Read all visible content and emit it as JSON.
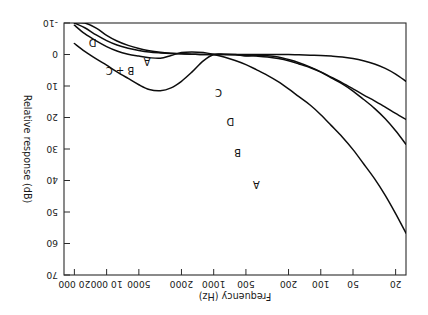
{
  "chart_data": {
    "type": "line",
    "title": "",
    "xlabel": "Frequency (Hz)",
    "ylabel": "Relative response (dB)",
    "xscale": "log",
    "xlim": [
      16,
      25000
    ],
    "ylim": [
      -10,
      70
    ],
    "grid": false,
    "legend": "inline-curve-labels",
    "rotated_180": true,
    "xticks": [
      20,
      50,
      100,
      200,
      500,
      1000,
      2000,
      5000,
      10000,
      20000
    ],
    "xtick_labels": [
      "20",
      "50",
      "100",
      "200",
      "500",
      "1000",
      "2000",
      "5000",
      "10 000",
      "20 000"
    ],
    "yticks": [
      -10,
      0,
      10,
      20,
      30,
      40,
      50,
      60,
      70
    ],
    "ytick_labels": [
      "-10",
      "0",
      "10",
      "20",
      "30",
      "40",
      "50",
      "60",
      "70"
    ],
    "series": [
      {
        "name": "A",
        "label": "A",
        "x": [
          16,
          20,
          25,
          31.5,
          40,
          50,
          63,
          80,
          100,
          125,
          160,
          200,
          250,
          315,
          400,
          500,
          630,
          800,
          1000,
          1250,
          1600,
          2000,
          2500,
          3150,
          4000,
          5000,
          6300,
          8000,
          10000,
          12500,
          16000,
          20000
        ],
        "y": [
          56.7,
          50.5,
          44.7,
          39.4,
          34.6,
          30.2,
          26.2,
          22.5,
          19.1,
          16.1,
          13.4,
          10.9,
          8.6,
          6.6,
          4.8,
          3.2,
          1.9,
          0.8,
          0.0,
          -0.6,
          -0.8,
          -0.6,
          0.3,
          1.2,
          1.0,
          0.5,
          -0.1,
          -1.1,
          -2.5,
          -4.3,
          -6.6,
          -9.3
        ]
      },
      {
        "name": "B",
        "label": "B",
        "x": [
          16,
          20,
          25,
          31.5,
          40,
          50,
          63,
          80,
          100,
          125,
          160,
          200,
          250,
          315,
          400,
          500,
          630,
          800,
          1000,
          1250,
          1600,
          2000,
          2500,
          3150,
          4000,
          5000,
          6300,
          8000,
          10000,
          12500,
          16000,
          20000
        ],
        "y": [
          28.5,
          24.2,
          20.4,
          17.1,
          14.2,
          11.6,
          9.3,
          7.4,
          5.6,
          4.2,
          3.0,
          2.0,
          1.3,
          0.8,
          0.5,
          0.3,
          0.1,
          0.0,
          0.0,
          0.0,
          -0.1,
          -0.2,
          -0.4,
          -0.7,
          -1.2,
          -1.9,
          -2.9,
          -4.3,
          -6.1,
          -8.4,
          -11.1,
          -14.1
        ]
      },
      {
        "name": "C",
        "label": "C",
        "x": [
          16,
          20,
          25,
          31.5,
          40,
          50,
          63,
          80,
          100,
          125,
          160,
          200,
          250,
          315,
          400,
          500,
          630,
          800,
          1000,
          1250,
          1600,
          2000,
          2500,
          3150,
          4000,
          5000,
          6300,
          8000,
          10000,
          12500,
          16000,
          20000
        ],
        "y": [
          8.5,
          6.2,
          4.4,
          3.0,
          2.0,
          1.3,
          0.8,
          0.5,
          0.3,
          0.2,
          0.1,
          0.0,
          0.0,
          0.0,
          0.0,
          0.0,
          0.0,
          0.0,
          0.0,
          0.0,
          -0.1,
          -0.2,
          -0.3,
          -0.5,
          -0.8,
          -1.3,
          -2.0,
          -3.0,
          -4.4,
          -6.2,
          -8.5,
          -11.2
        ]
      },
      {
        "name": "D",
        "label": "D",
        "x": [
          16,
          20,
          25,
          31.5,
          40,
          50,
          63,
          80,
          100,
          125,
          160,
          200,
          250,
          315,
          400,
          500,
          630,
          800,
          1000,
          1250,
          1600,
          2000,
          2500,
          3150,
          4000,
          5000,
          6300,
          8000,
          10000,
          12500,
          16000,
          20000
        ],
        "y": [
          20.6,
          18.7,
          16.7,
          14.7,
          12.8,
          10.9,
          9.0,
          7.2,
          5.5,
          4.0,
          2.6,
          1.6,
          0.8,
          0.4,
          0.3,
          0.5,
          0.0,
          -0.1,
          0.0,
          2.0,
          5.6,
          8.5,
          10.6,
          11.5,
          11.1,
          9.6,
          7.6,
          5.5,
          3.4,
          1.4,
          -1.0,
          -3.5
        ]
      },
      {
        "name": "B + C",
        "label": "B + C",
        "is_annotation_only": true
      }
    ],
    "curve_annotations": [
      {
        "text": "A",
        "x": 400,
        "y": 40
      },
      {
        "text": "B",
        "x": 600,
        "y": 30
      },
      {
        "text": "D",
        "x": 700,
        "y": 20
      },
      {
        "text": "C",
        "x": 900,
        "y": 11
      },
      {
        "text": "B + C",
        "x": 7500,
        "y": 4
      },
      {
        "text": "A",
        "x": 4200,
        "y": 1
      },
      {
        "text": "D",
        "x": 13500,
        "y": -5
      }
    ]
  },
  "colors": {
    "background": "#ffffff",
    "axis": "#2b2b2b",
    "curve": "#0d0d0d",
    "text": "#1a1a1a"
  }
}
